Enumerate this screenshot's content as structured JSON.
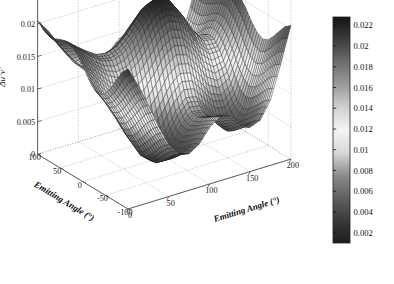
{
  "figure": {
    "type": "3d-surface-plot",
    "background_color": "#ffffff",
    "title": ""
  },
  "axes": {
    "x": {
      "label": "Emitting Angle (°)",
      "ticks": [
        0,
        50,
        100,
        150,
        200
      ],
      "tick_labels": [
        "0",
        "50",
        "100",
        "150",
        "200"
      ],
      "range": [
        0,
        200
      ]
    },
    "y": {
      "label": "Emitting Angle (°)",
      "ticks": [
        -100,
        -50,
        0,
        50,
        100
      ],
      "tick_labels": [
        "-100",
        "-50",
        "0",
        "50",
        "100"
      ],
      "range": [
        -100,
        100
      ]
    },
    "z": {
      "label": "Δu’v’",
      "ticks": [
        0,
        0.005,
        0.01,
        0.015,
        0.02,
        0.025
      ],
      "tick_labels": [
        "0",
        "0.005",
        "0.01",
        "0.015",
        "0.02",
        "0.025"
      ],
      "range": [
        0,
        0.025
      ]
    }
  },
  "colorbar": {
    "position": "right",
    "ticks": [
      0.002,
      0.004,
      0.006,
      0.008,
      0.01,
      0.012,
      0.014,
      0.016,
      0.018,
      0.02,
      0.022
    ],
    "tick_labels": [
      "0.002",
      "0.004",
      "0.006",
      "0.008",
      "0.01",
      "0.012",
      "0.014",
      "0.016",
      "0.018",
      "0.02",
      "0.022"
    ],
    "range": [
      0.001,
      0.0228
    ],
    "colormap": "grayscale-jet",
    "stops": [
      "#1c1c1c",
      "#3a3a3a",
      "#606060",
      "#8c8c8c",
      "#d8d8d8",
      "#f4f4f4",
      "#d0d0d0",
      "#9a9a9a",
      "#6e6e6e",
      "#3c3c3c",
      "#141414"
    ]
  },
  "chart_data": {
    "type": "surface",
    "title": "",
    "xlabel": "Emitting Angle (°)",
    "ylabel": "Emitting Angle (°)",
    "zlabel": "Δu’v’",
    "xlim": [
      0,
      200
    ],
    "ylim": [
      -100,
      100
    ],
    "zlim": [
      0,
      0.025
    ],
    "grid": true,
    "legend": "none",
    "colorbar_range": [
      0.001,
      0.0228
    ],
    "x": [
      0,
      12.5,
      25,
      37.5,
      50,
      62.5,
      75,
      87.5,
      100,
      112.5,
      125,
      137.5,
      150,
      162.5,
      175,
      187.5,
      200
    ],
    "y": [
      -100,
      -87.5,
      -75,
      -62.5,
      -50,
      -37.5,
      -25,
      -12.5,
      0,
      12.5,
      25,
      37.5,
      50,
      62.5,
      75,
      87.5,
      100
    ],
    "z": [
      [
        0.0215,
        0.0185,
        0.015,
        0.0112,
        0.008,
        0.006,
        0.0056,
        0.0066,
        0.0086,
        0.0098,
        0.0094,
        0.008,
        0.0068,
        0.0074,
        0.01,
        0.015,
        0.0205
      ],
      [
        0.0205,
        0.0176,
        0.0142,
        0.0104,
        0.0073,
        0.0054,
        0.0051,
        0.0061,
        0.0081,
        0.0093,
        0.009,
        0.0076,
        0.0063,
        0.0068,
        0.0094,
        0.0144,
        0.0198
      ],
      [
        0.0188,
        0.016,
        0.0128,
        0.0092,
        0.0062,
        0.0044,
        0.0042,
        0.0053,
        0.0074,
        0.0087,
        0.0084,
        0.0069,
        0.0055,
        0.0059,
        0.0084,
        0.0133,
        0.0186
      ],
      [
        0.017,
        0.0144,
        0.0113,
        0.0079,
        0.005,
        0.0034,
        0.0033,
        0.0045,
        0.0067,
        0.0081,
        0.0078,
        0.0062,
        0.0047,
        0.005,
        0.0074,
        0.0121,
        0.0173
      ],
      [
        0.0156,
        0.0131,
        0.0101,
        0.0068,
        0.004,
        0.0026,
        0.0026,
        0.0039,
        0.0062,
        0.0077,
        0.0074,
        0.0057,
        0.0041,
        0.0043,
        0.0065,
        0.0111,
        0.0162
      ],
      [
        0.0149,
        0.0125,
        0.0096,
        0.0064,
        0.0037,
        0.0024,
        0.0025,
        0.0039,
        0.0064,
        0.008,
        0.0077,
        0.0059,
        0.0041,
        0.0042,
        0.0062,
        0.0107,
        0.0158
      ],
      [
        0.0152,
        0.0129,
        0.0101,
        0.0071,
        0.0046,
        0.0035,
        0.0038,
        0.0054,
        0.008,
        0.0096,
        0.0093,
        0.0074,
        0.0055,
        0.0053,
        0.007,
        0.0113,
        0.0163
      ],
      [
        0.0163,
        0.0142,
        0.0117,
        0.0091,
        0.0071,
        0.0064,
        0.007,
        0.0089,
        0.0114,
        0.0128,
        0.0124,
        0.0105,
        0.0083,
        0.0076,
        0.0088,
        0.0127,
        0.0175
      ],
      [
        0.0178,
        0.0159,
        0.0139,
        0.0119,
        0.0105,
        0.0103,
        0.0112,
        0.0131,
        0.0154,
        0.0165,
        0.016,
        0.014,
        0.0116,
        0.0104,
        0.011,
        0.0145,
        0.019
      ],
      [
        0.019,
        0.0174,
        0.0158,
        0.0143,
        0.0135,
        0.0137,
        0.0149,
        0.0168,
        0.0188,
        0.0197,
        0.0191,
        0.017,
        0.0144,
        0.0128,
        0.0129,
        0.016,
        0.0202
      ],
      [
        0.0198,
        0.0184,
        0.0171,
        0.016,
        0.0156,
        0.0161,
        0.0175,
        0.0194,
        0.0212,
        0.0219,
        0.0212,
        0.019,
        0.0162,
        0.0143,
        0.0141,
        0.0169,
        0.0209
      ],
      [
        0.02,
        0.0187,
        0.0175,
        0.0165,
        0.0162,
        0.0168,
        0.0182,
        0.0201,
        0.0218,
        0.0224,
        0.0217,
        0.0194,
        0.0166,
        0.0146,
        0.0143,
        0.017,
        0.021
      ],
      [
        0.0197,
        0.0183,
        0.017,
        0.0158,
        0.0153,
        0.0157,
        0.017,
        0.0188,
        0.0205,
        0.0212,
        0.0205,
        0.0183,
        0.0156,
        0.0137,
        0.0136,
        0.0165,
        0.0207
      ],
      [
        0.0193,
        0.0177,
        0.016,
        0.0145,
        0.0136,
        0.0137,
        0.0147,
        0.0164,
        0.0181,
        0.0189,
        0.0183,
        0.0162,
        0.0137,
        0.0121,
        0.0124,
        0.0157,
        0.0203
      ],
      [
        0.0192,
        0.0174,
        0.0153,
        0.0134,
        0.0121,
        0.0118,
        0.0125,
        0.014,
        0.0157,
        0.0165,
        0.016,
        0.0141,
        0.0118,
        0.0105,
        0.0113,
        0.0151,
        0.0201
      ],
      [
        0.0196,
        0.0177,
        0.0154,
        0.0132,
        0.0116,
        0.011,
        0.0114,
        0.0127,
        0.0143,
        0.0151,
        0.0147,
        0.0129,
        0.0108,
        0.0097,
        0.0108,
        0.015,
        0.0203
      ],
      [
        0.0205,
        0.0185,
        0.0161,
        0.0137,
        0.0119,
        0.011,
        0.0113,
        0.0124,
        0.0139,
        0.0146,
        0.0142,
        0.0125,
        0.0104,
        0.0095,
        0.0109,
        0.0155,
        0.021
      ]
    ],
    "features": {
      "description": "Saddle-shaped surface with high ridges along the left-rear and right-rear corners, a tall central-rear peak reaching ~0.0224, a secondary mid-height mound in the foreground center, and deep valleys near the front-left and front-center dipping to ~0.0024",
      "max_value": 0.0224,
      "min_value": 0.0024
    }
  },
  "icons": {
    "degree_symbol": "degree-symbol"
  }
}
